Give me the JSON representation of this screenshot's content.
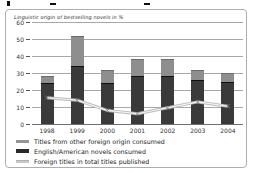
{
  "chart_data": {
    "type": "bar",
    "subtype": "stacked-bars-with-line-overlay",
    "title": "Linguistic origin of bestselling novels in %",
    "categories": [
      "1998",
      "1999",
      "2000",
      "2001",
      "2002",
      "2003",
      "2004"
    ],
    "series": [
      {
        "name": "English/American novels consumed",
        "render": "bar",
        "color": "#3a3a3a",
        "values": [
          24,
          34,
          24,
          28,
          28,
          26,
          25
        ]
      },
      {
        "name": "Titles from other foreign origin consumed",
        "render": "bar",
        "color": "#8e8e8e",
        "values": [
          4,
          18,
          8,
          10,
          10,
          6,
          5
        ]
      },
      {
        "name": "Foreign titles in total titles published",
        "render": "line",
        "color": "#bcbcbc",
        "values": [
          15.5,
          14,
          8,
          6,
          9.5,
          13,
          10.5
        ]
      }
    ],
    "stack_totals": [
      28,
      52,
      32,
      38,
      38,
      32,
      30
    ],
    "ylim": [
      0,
      60
    ],
    "ytick_interval": 10,
    "ytick_labels": [
      "60",
      "50",
      "40",
      "30",
      "20",
      "10",
      "0"
    ],
    "grid": "horizontal",
    "legend_position": "bottom-left",
    "legend_order_note": "legend lists: other-foreign bar, english-american bar, line"
  },
  "colors": {
    "bar_dark": "#3a3a3a",
    "bar_light": "#8e8e8e",
    "line": "#bcbcbc",
    "gridline": "#a8a8a8",
    "card_border": "#adadad",
    "background": "#ffffff"
  }
}
